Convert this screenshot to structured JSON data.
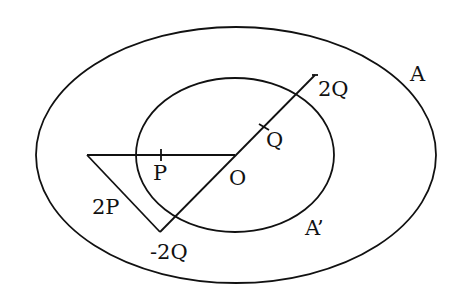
{
  "diagram": {
    "type": "geometry-figure",
    "regions": [
      {
        "id": "outer",
        "label": "A"
      },
      {
        "id": "inner",
        "label": "A’"
      }
    ],
    "points": [
      {
        "id": "O",
        "label": "O"
      },
      {
        "id": "P",
        "label": "P"
      },
      {
        "id": "2P",
        "label": "2P"
      },
      {
        "id": "Q",
        "label": "Q"
      },
      {
        "id": "2Q",
        "label": "2Q"
      },
      {
        "id": "neg2Q",
        "label": "-2Q"
      }
    ],
    "stroke_color": "#111111",
    "background": "#ffffff"
  }
}
